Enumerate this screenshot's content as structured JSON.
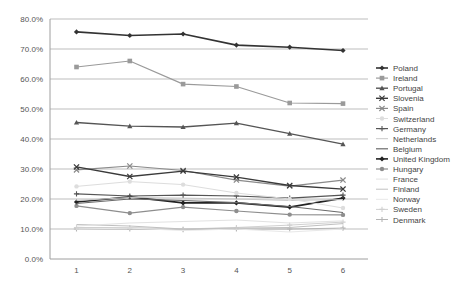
{
  "chart_data": {
    "type": "line",
    "title": "",
    "xlabel": "",
    "ylabel": "",
    "x": [
      1,
      2,
      3,
      4,
      5,
      6
    ],
    "ylim": [
      0,
      80
    ],
    "yticks": [
      "0.0%",
      "10.0%",
      "20.0%",
      "30.0%",
      "40.0%",
      "50.0%",
      "60.0%",
      "70.0%",
      "80.0%"
    ],
    "xticks": [
      "1",
      "2",
      "3",
      "4",
      "5",
      "6"
    ],
    "grid": true,
    "legend_position": "right",
    "series": [
      {
        "name": "Poland",
        "values": [
          75.7,
          74.5,
          75.0,
          71.3,
          70.6,
          69.5
        ],
        "color": "#333333",
        "marker": "diamond",
        "width": 1.6
      },
      {
        "name": "Ireland",
        "values": [
          64.0,
          66.0,
          58.3,
          57.5,
          52.0,
          51.8
        ],
        "color": "#9a9a9a",
        "marker": "square",
        "width": 1.2
      },
      {
        "name": "Portugal",
        "values": [
          45.5,
          44.3,
          44.0,
          45.3,
          41.8,
          38.3
        ],
        "color": "#555555",
        "marker": "triangle",
        "width": 1.4
      },
      {
        "name": "Slovenia",
        "values": [
          30.7,
          27.5,
          29.3,
          27.3,
          24.5,
          23.3
        ],
        "color": "#3a3a3a",
        "marker": "x",
        "width": 1.4
      },
      {
        "name": "Spain",
        "values": [
          29.7,
          31.0,
          29.5,
          26.3,
          24.3,
          26.3
        ],
        "color": "#8a8a8a",
        "marker": "x",
        "width": 1.2
      },
      {
        "name": "Switzerland",
        "values": [
          24.2,
          25.8,
          24.8,
          22.0,
          20.0,
          17.0
        ],
        "color": "#dddddd",
        "marker": "circle",
        "width": 1.0
      },
      {
        "name": "Germany",
        "values": [
          21.7,
          21.0,
          21.3,
          21.0,
          20.3,
          21.3
        ],
        "color": "#555555",
        "marker": "plus",
        "width": 1.2
      },
      {
        "name": "Netherlands",
        "values": [
          19.5,
          20.5,
          20.3,
          20.0,
          19.5,
          19.8
        ],
        "color": "#c8c8c8",
        "marker": "none",
        "width": 1.0
      },
      {
        "name": "Belgium",
        "values": [
          18.5,
          20.0,
          19.5,
          18.8,
          17.5,
          15.5
        ],
        "color": "#6a6a6a",
        "marker": "none",
        "width": 1.2
      },
      {
        "name": "United Kingdom",
        "values": [
          19.0,
          20.7,
          18.7,
          18.7,
          17.3,
          20.3
        ],
        "color": "#222222",
        "marker": "diamond",
        "width": 1.6
      },
      {
        "name": "Hungary",
        "values": [
          17.7,
          15.3,
          17.3,
          16.0,
          14.8,
          14.7
        ],
        "color": "#8e8e8e",
        "marker": "circle",
        "width": 1.2
      },
      {
        "name": "France",
        "values": [
          11.0,
          12.0,
          12.5,
          13.0,
          12.0,
          12.7
        ],
        "color": "#e2e2e2",
        "marker": "none",
        "width": 1.0
      },
      {
        "name": "Finland",
        "values": [
          11.5,
          11.0,
          10.0,
          10.3,
          10.5,
          11.8
        ],
        "color": "#c0c0c0",
        "marker": "none",
        "width": 1.0
      },
      {
        "name": "Norway",
        "values": [
          10.0,
          10.3,
          9.5,
          10.0,
          9.0,
          10.0
        ],
        "color": "#e8e8e8",
        "marker": "none",
        "width": 1.0
      },
      {
        "name": "Sweden",
        "values": [
          10.5,
          10.5,
          10.0,
          10.5,
          11.3,
          12.3
        ],
        "color": "#d0d0d0",
        "marker": "plus",
        "width": 1.0
      },
      {
        "name": "Denmark",
        "values": [
          10.0,
          10.0,
          9.8,
          10.0,
          10.0,
          10.3
        ],
        "color": "#b5b5b5",
        "marker": "plus",
        "width": 1.0
      }
    ]
  },
  "colors": {
    "grid": "#bdbdbd",
    "axis": "#9e9e9e",
    "background": "#ffffff"
  }
}
